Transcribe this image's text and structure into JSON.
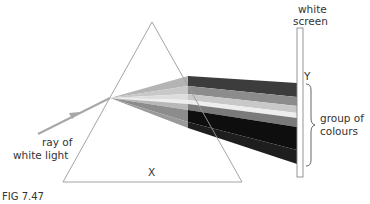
{
  "figure": {
    "caption": "FIG 7.47",
    "labels": {
      "screen_line1": "white",
      "screen_line2": "screen",
      "point_y": "Y",
      "group_line1": "group of",
      "group_line2": "colours",
      "ray_line1": "ray of",
      "ray_line2": "white light",
      "point_x": "X"
    },
    "colors": {
      "prism_outline": "#9a9a9a",
      "ray": "#a8a8a8",
      "screen_outline": "#8a8a8a",
      "text": "#333333"
    },
    "spectrum_bands": [
      {
        "name": "band-1",
        "color": "#3c3c3c",
        "y_top": 83,
        "y_bottom": 97
      },
      {
        "name": "band-2",
        "color": "#8c8c8c",
        "y_top": 97,
        "y_bottom": 106
      },
      {
        "name": "band-3",
        "color": "#c8c8c8",
        "y_top": 106,
        "y_bottom": 113
      },
      {
        "name": "band-4",
        "color": "#ededed",
        "y_top": 113,
        "y_bottom": 118
      },
      {
        "name": "band-5",
        "color": "#7a7a7a",
        "y_top": 118,
        "y_bottom": 127
      },
      {
        "name": "band-6",
        "color": "#0e0e0e",
        "y_top": 127,
        "y_bottom": 150
      },
      {
        "name": "band-7",
        "color": "#1e1e1e",
        "y_top": 150,
        "y_bottom": 164
      }
    ]
  }
}
